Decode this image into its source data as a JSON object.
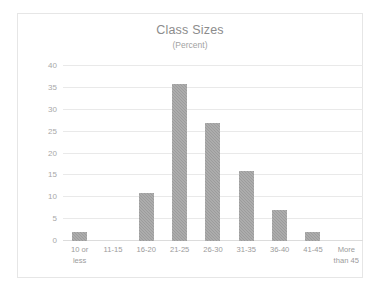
{
  "chart_data": {
    "type": "bar",
    "title": "Class Sizes",
    "subtitle": "(Percent)",
    "xlabel": "",
    "ylabel": "",
    "categories": [
      "10 or\nless",
      "11-15",
      "16-20",
      "21-25",
      "26-30",
      "31-35",
      "36-40",
      "41-45",
      "More\nthan 45"
    ],
    "values": [
      2,
      0,
      11,
      36,
      27,
      16,
      7,
      2,
      0
    ],
    "ylim": [
      0,
      40
    ],
    "ytick_labels": [
      "0",
      "5",
      "10",
      "15",
      "20",
      "25",
      "30",
      "35",
      "40"
    ],
    "ytick_values": [
      0,
      5,
      10,
      15,
      20,
      25,
      30,
      35,
      40
    ],
    "grid": true,
    "legend": false,
    "bar_color": "#9c9c9c",
    "gridline_color": "#e9e9e9",
    "text_color": "#9b9b9b",
    "border_color": "#e6e6e6",
    "background": "#ffffff"
  }
}
